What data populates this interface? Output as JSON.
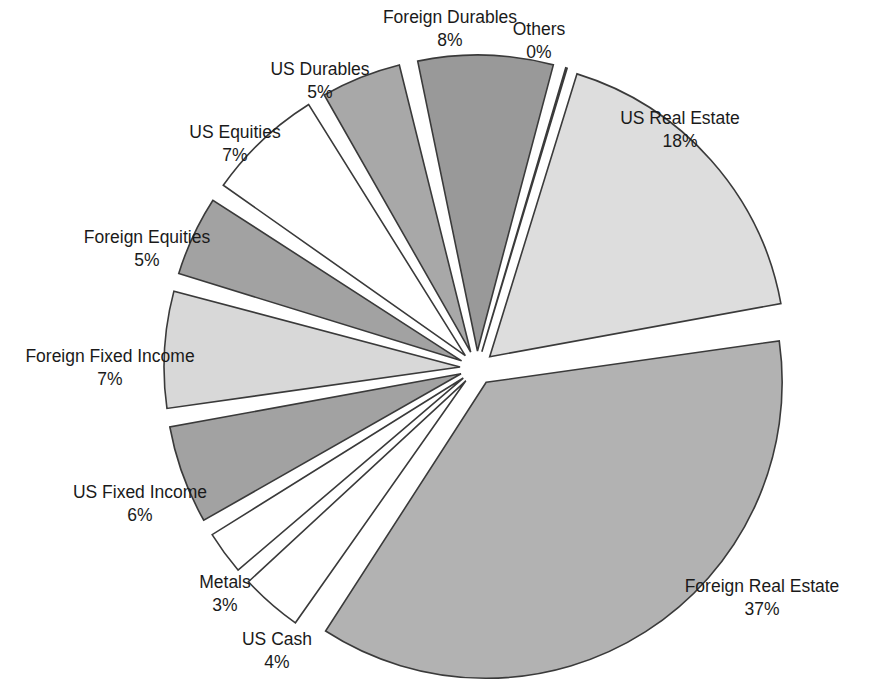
{
  "chart_data": {
    "type": "pie",
    "title": "",
    "subtitle": "",
    "legend_position": "labels-outside",
    "exploded": true,
    "grid": false,
    "start_angle_deg": -74,
    "direction": "clockwise",
    "categories": [
      "US Real Estate",
      "Foreign Real Estate",
      "US Cash",
      "Metals",
      "US Fixed Income",
      "Foreign Fixed Income",
      "Foreign Equities",
      "US Equities",
      "US Durables",
      "Foreign Durables",
      "Others"
    ],
    "values": [
      18,
      37,
      4,
      3,
      6,
      7,
      5,
      7,
      5,
      8,
      0
    ],
    "value_labels": [
      "18%",
      "37%",
      "4%",
      "3%",
      "6%",
      "7%",
      "5%",
      "7%",
      "5%",
      "8%",
      "0%"
    ],
    "unit": "%",
    "colors": [
      "#dddddd",
      "#b2b2b2",
      "#ffffff",
      "#ffffff",
      "#a2a2a2",
      "#d8d8d8",
      "#a2a2a2",
      "#ffffff",
      "#a8a8a8",
      "#999999",
      "#ffffff"
    ],
    "stroke_color": "#3a3a3a",
    "slices": [
      {
        "name": "US Real Estate",
        "value": 18,
        "value_label": "18%",
        "color": "#dddddd",
        "label_x": 680,
        "label_y": 124,
        "pct_x": 680,
        "pct_y": 147,
        "anchor": "middle"
      },
      {
        "name": "Foreign Real Estate",
        "value": 37,
        "value_label": "37%",
        "color": "#b2b2b2",
        "label_x": 762,
        "label_y": 592,
        "pct_x": 762,
        "pct_y": 615,
        "anchor": "middle"
      },
      {
        "name": "US Cash",
        "value": 4,
        "value_label": "4%",
        "color": "#ffffff",
        "label_x": 277,
        "label_y": 645,
        "pct_x": 277,
        "pct_y": 668,
        "anchor": "middle"
      },
      {
        "name": "Metals",
        "value": 3,
        "value_label": "3%",
        "color": "#ffffff",
        "label_x": 225,
        "label_y": 588,
        "pct_x": 225,
        "pct_y": 611,
        "anchor": "middle"
      },
      {
        "name": "US Fixed Income",
        "value": 6,
        "value_label": "6%",
        "color": "#a2a2a2",
        "label_x": 140,
        "label_y": 498,
        "pct_x": 140,
        "pct_y": 521,
        "anchor": "middle"
      },
      {
        "name": "Foreign Fixed Income",
        "value": 7,
        "value_label": "7%",
        "color": "#d8d8d8",
        "label_x": 110,
        "label_y": 362,
        "pct_x": 110,
        "pct_y": 385,
        "anchor": "middle"
      },
      {
        "name": "Foreign Equities",
        "value": 5,
        "value_label": "5%",
        "color": "#a2a2a2",
        "label_x": 147,
        "label_y": 243,
        "pct_x": 147,
        "pct_y": 266,
        "anchor": "middle"
      },
      {
        "name": "US Equities",
        "value": 7,
        "value_label": "7%",
        "color": "#ffffff",
        "label_x": 235,
        "label_y": 138,
        "pct_x": 235,
        "pct_y": 161,
        "anchor": "middle"
      },
      {
        "name": "US Durables",
        "value": 5,
        "value_label": "5%",
        "color": "#a8a8a8",
        "label_x": 320,
        "label_y": 75,
        "pct_x": 320,
        "pct_y": 98,
        "anchor": "middle"
      },
      {
        "name": "Foreign Durables",
        "value": 8,
        "value_label": "8%",
        "color": "#999999",
        "label_x": 450,
        "label_y": 23,
        "pct_x": 450,
        "pct_y": 46,
        "anchor": "middle"
      },
      {
        "name": "Others",
        "value": 0,
        "value_label": "0%",
        "color": "#ffffff",
        "label_x": 539,
        "label_y": 35,
        "pct_x": 539,
        "pct_y": 58,
        "anchor": "middle"
      }
    ]
  },
  "geometry": {
    "cx": 477,
    "cy": 368,
    "radius": 296,
    "explode": 17
  }
}
